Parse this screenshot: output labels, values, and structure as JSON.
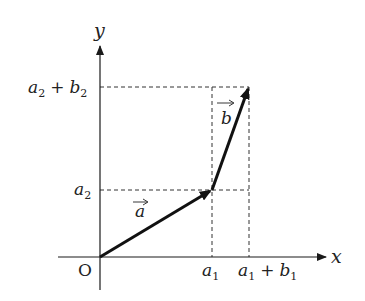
{
  "diagram": {
    "axes": {
      "x_label": "x",
      "y_label": "y",
      "origin_label": "O"
    },
    "x_ticks": [
      {
        "base": "a",
        "sub": "1",
        "plus": "",
        "base2": "",
        "sub2": ""
      },
      {
        "base": "a",
        "sub": "1",
        "plus": "+",
        "base2": "b",
        "sub2": "1"
      }
    ],
    "y_ticks": [
      {
        "base": "a",
        "sub": "2",
        "plus": "",
        "base2": "",
        "sub2": ""
      },
      {
        "base": "a",
        "sub": "2",
        "plus": "+",
        "base2": "b",
        "sub2": "2"
      }
    ],
    "vectors": [
      {
        "name": "a",
        "from": "O",
        "to": "(a1, a2)"
      },
      {
        "name": "b",
        "from": "(a1, a2)",
        "to": "(a1+b1, a2+b2)"
      }
    ],
    "colors": {
      "ink": "#1a1a1a",
      "background": "#ffffff"
    }
  }
}
